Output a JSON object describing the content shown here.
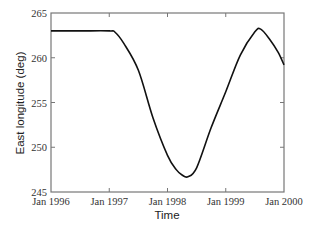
{
  "chart_data": {
    "type": "line",
    "title": "",
    "xlabel": "Time",
    "ylabel": "East longitude (deg)",
    "xlim": [
      1996.0,
      2000.0
    ],
    "ylim": [
      245,
      265
    ],
    "x_ticks": [
      1996,
      1997,
      1998,
      1999,
      2000
    ],
    "x_tick_labels": [
      "Jan 1996",
      "Jan 1997",
      "Jan 1998",
      "Jan 1999",
      "Jan 2000"
    ],
    "y_ticks": [
      245,
      250,
      255,
      260,
      265
    ],
    "y_tick_labels": [
      "245",
      "250",
      "255",
      "260",
      "265"
    ],
    "grid": false,
    "legend": null,
    "series": [
      {
        "name": "East longitude",
        "color": "#111111",
        "x": [
          1996.0,
          1996.5,
          1997.0,
          1997.1,
          1997.25,
          1997.5,
          1997.75,
          1998.0,
          1998.15,
          1998.25,
          1998.35,
          1998.5,
          1998.75,
          1999.0,
          1999.25,
          1999.5,
          1999.6,
          1999.75,
          1999.9,
          2000.0
        ],
        "values": [
          263.0,
          263.0,
          263.0,
          262.85,
          261.6,
          258.6,
          253.3,
          249.1,
          247.5,
          246.9,
          246.7,
          247.7,
          252.2,
          256.2,
          260.3,
          262.9,
          263.2,
          262.1,
          260.6,
          259.2
        ]
      }
    ]
  }
}
